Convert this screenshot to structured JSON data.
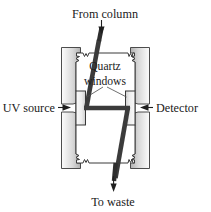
{
  "figure": {
    "background_color": "#ffffff",
    "width": 211,
    "height": 212
  },
  "labels": {
    "from_column": "From column",
    "quartz_windows_line1": "Quartz",
    "quartz_windows_line2": "windows",
    "uv_source": "UV source",
    "detector": "Detector",
    "to_waste": "To waste"
  },
  "colors": {
    "outline": "#2b2b2b",
    "text": "#1a1a1a",
    "flow_path": "#3a3a3a",
    "light_beam": "#4a4a4a",
    "block_light": "#f2f2f2",
    "block_mid": "#d2d2d2",
    "block_dark": "#9a9a9a",
    "body_fill": "#ffffff",
    "window_fill": "#fbfbfb"
  },
  "parts": {
    "inlet_tube": "inlet capillary from column",
    "outlet_tube": "outlet capillary to waste",
    "left_clamp": "left clamp block",
    "right_clamp": "right clamp block",
    "left_window": "left quartz window",
    "right_window": "right quartz window",
    "cell_body": "flow cell body",
    "beam": "UV light beam"
  }
}
